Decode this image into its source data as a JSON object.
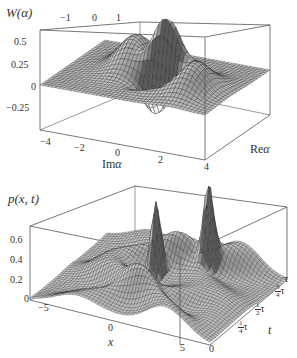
{
  "chart_data": [
    {
      "type": "surface3d",
      "title": "",
      "zlabel": "W(α)",
      "xlabel": "Im α",
      "ylabel": "Re α",
      "x_ticks": [
        "−4",
        "−2",
        "0",
        "2",
        "4"
      ],
      "y_ticks_back": [
        "−1",
        "0",
        "1"
      ],
      "z_ticks": [
        "0.5",
        "0.25",
        "0",
        "−0.25"
      ],
      "zlim": [
        -0.35,
        0.6
      ],
      "xlim": [
        -4.5,
        4.5
      ],
      "description": "Wigner function of a superposition state: two positive Gaussian lobes at Im α ≈ ±2 (peak ≈ 0.3) and a central oscillating interference fringe near Im α ≈ 0 with max ≈ 0.55 and negative dips ≈ −0.3",
      "features": [
        {
          "name": "left-gaussian",
          "im_alpha": -1.5,
          "peak": 0.32
        },
        {
          "name": "central-interference-max",
          "im_alpha": 0.5,
          "peak": 0.55
        },
        {
          "name": "interference-min",
          "im_alpha": 0.2,
          "value": -0.3
        },
        {
          "name": "right-gaussian",
          "im_alpha": 2.5,
          "peak": 0.3
        }
      ]
    },
    {
      "type": "surface3d",
      "title": "",
      "zlabel": "p(x,t)",
      "xlabel": "x",
      "ylabel": "t",
      "x_ticks": [
        "−5",
        "0",
        "5"
      ],
      "t_ticks": [
        "0",
        "¼τ",
        "½τ",
        "¾τ",
        "τ"
      ],
      "z_ticks": [
        "0.6",
        "0.4",
        "0.2",
        "0"
      ],
      "zlim": [
        0,
        0.75
      ],
      "xlim": [
        -7,
        7
      ],
      "description": "Probability density evolving over one period τ: two sharp peaks (~0.7) near x≈0 at t≈½τ, broad Gaussian ridges elsewhere",
      "features": [
        {
          "name": "sharp-peak-1",
          "x": -0.5,
          "t": "½τ",
          "peak": 0.68
        },
        {
          "name": "sharp-peak-2",
          "x": 2.5,
          "t": "¾τ",
          "peak": 0.72
        }
      ]
    }
  ],
  "top": {
    "zlabel": "W(α)",
    "xlabel_prefix": "Im",
    "xlabel_var": "α",
    "ylabel_prefix": "Re",
    "ylabel_var": "α",
    "back_ticks": [
      "−1",
      "0",
      "1"
    ],
    "z_ticks": [
      "0.5",
      "0.25",
      "0",
      "−0.25"
    ],
    "x_ticks": [
      "−4",
      "−2",
      "0",
      "2",
      "4"
    ]
  },
  "bottom": {
    "zlabel": "p(x, t)",
    "xlabel": "x",
    "tlabel": "t",
    "z_ticks": [
      "0.6",
      "0.4",
      "0.2",
      "0"
    ],
    "x_ticks": [
      "−5",
      "0",
      "5"
    ],
    "t_zero": "0",
    "t_tau": "τ",
    "t_frac": [
      {
        "num": "3",
        "den": "4",
        "sym": "τ"
      },
      {
        "num": "1",
        "den": "2",
        "sym": "τ"
      },
      {
        "num": "1",
        "den": "4",
        "sym": "τ"
      }
    ]
  }
}
